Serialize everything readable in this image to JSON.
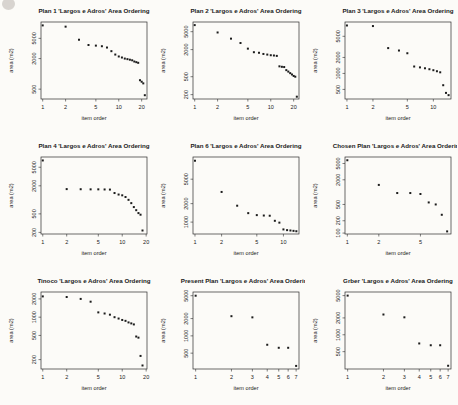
{
  "figure": {
    "background": "#fcfbf8"
  },
  "style": {
    "point_color": "#1c1c1c",
    "axis_color": "#2b2b2b",
    "text_color": "#1a1a1a"
  },
  "chart_data": [
    {
      "type": "scatter",
      "title": "Plan 1 'Largos e Adros' Area Ordering",
      "xlabel": "item order",
      "ylabel": "area (m2)",
      "xscale": "log",
      "yscale": "log",
      "x": [
        1,
        2,
        3,
        4,
        5,
        6,
        7,
        8,
        9,
        10,
        11,
        12,
        13,
        14,
        15,
        16,
        17,
        18,
        19,
        20,
        21,
        22
      ],
      "y": [
        9000,
        8500,
        4700,
        3700,
        3600,
        3500,
        3300,
        2800,
        2400,
        2200,
        2100,
        2000,
        1950,
        1900,
        1850,
        1750,
        1700,
        1650,
        750,
        700,
        650,
        380
      ],
      "xticks": [
        1,
        2,
        5,
        10,
        20
      ],
      "yticks": [
        500,
        2000,
        5000
      ],
      "xlim": [
        0.95,
        23.5
      ],
      "ylim": [
        320,
        10500
      ]
    },
    {
      "type": "scatter",
      "title": "Plan 2 'Largos e Adros' Area Ordering",
      "xlabel": "item order",
      "ylabel": "area (m2)",
      "xscale": "log",
      "yscale": "log",
      "x": [
        1,
        2,
        3,
        4,
        5,
        6,
        7,
        8,
        9,
        10,
        11,
        12,
        13,
        14,
        15,
        16,
        17,
        18,
        19,
        20,
        21,
        22
      ],
      "y": [
        7000,
        4800,
        3500,
        2800,
        2100,
        1750,
        1700,
        1600,
        1550,
        1500,
        1480,
        1450,
        850,
        830,
        820,
        700,
        650,
        600,
        560,
        520,
        500,
        180
      ],
      "xticks": [
        1,
        2,
        5,
        10,
        20
      ],
      "yticks": [
        200,
        500,
        2000,
        5000
      ],
      "xlim": [
        0.95,
        23.5
      ],
      "ylim": [
        160,
        8200
      ]
    },
    {
      "type": "scatter",
      "title": "Plan 3 'Largos e Adros' Area Ordering",
      "xlabel": "item order",
      "ylabel": "area (m2)",
      "xscale": "log",
      "yscale": "log",
      "x": [
        1,
        2,
        3,
        4,
        5,
        6,
        7,
        8,
        9,
        10,
        11,
        12,
        13,
        14,
        15
      ],
      "y": [
        8000,
        7800,
        3000,
        2700,
        2400,
        1350,
        1300,
        1250,
        1200,
        1150,
        1100,
        1050,
        600,
        430,
        390
      ],
      "xticks": [
        1,
        2,
        5,
        10
      ],
      "yticks": [
        500,
        1000,
        2000,
        5000
      ],
      "xlim": [
        0.95,
        16
      ],
      "ylim": [
        330,
        9300
      ]
    },
    {
      "type": "scatter",
      "title": "Plan 4 'Largos e Adros' Area Ordering",
      "xlabel": "item order",
      "ylabel": "area (m2)",
      "xscale": "log",
      "yscale": "log",
      "x": [
        1,
        2,
        3,
        4,
        5,
        6,
        7,
        8,
        9,
        10,
        11,
        12,
        13,
        14,
        15,
        16,
        17,
        18
      ],
      "y": [
        7000,
        1700,
        1690,
        1680,
        1680,
        1670,
        1660,
        1400,
        1300,
        1250,
        1150,
        1000,
        850,
        700,
        600,
        520,
        480,
        220
      ],
      "xticks": [
        1,
        2,
        5,
        10,
        20
      ],
      "yticks": [
        200,
        500,
        2000,
        5000
      ],
      "xlim": [
        0.95,
        20.5
      ],
      "ylim": [
        185,
        8300
      ]
    },
    {
      "type": "scatter",
      "title": "Plan 6 'Largos e Adros' Area Ordering",
      "xlabel": "item order",
      "ylabel": "area (m2)",
      "xscale": "log",
      "yscale": "log",
      "x": [
        1,
        2,
        3,
        4,
        5,
        6,
        7,
        8,
        9,
        10,
        11,
        12,
        13,
        14
      ],
      "y": [
        10000,
        3100,
        1850,
        1400,
        1300,
        1280,
        1270,
        1050,
        980,
        760,
        740,
        730,
        720,
        710
      ],
      "xticks": [
        1,
        2,
        5,
        10
      ],
      "yticks": [
        1000,
        2000,
        5000
      ],
      "xlim": [
        0.95,
        15
      ],
      "ylim": [
        640,
        11500
      ]
    },
    {
      "type": "scatter",
      "title": "Chosen Plan 'Largos e Adros' Area Ordering",
      "xlabel": "item order",
      "ylabel": "area (m2)",
      "xscale": "log",
      "yscale": "log",
      "x": [
        1,
        2,
        3,
        4,
        5,
        6,
        7,
        8,
        9
      ],
      "y": [
        6000,
        1500,
        950,
        950,
        900,
        560,
        500,
        280,
        110
      ],
      "xticks": [
        1,
        2,
        5
      ],
      "yticks": [
        100,
        200,
        500,
        2000,
        5000
      ],
      "xlim": [
        0.95,
        9.8
      ],
      "ylim": [
        95,
        7200
      ]
    },
    {
      "type": "scatter",
      "title": "Tinoco 'Largos e Adros' Area Ordering",
      "xlabel": "item order",
      "ylabel": "area (m2)",
      "xscale": "log",
      "yscale": "log",
      "x": [
        1,
        2,
        3,
        4,
        5,
        6,
        7,
        8,
        9,
        10,
        11,
        12,
        13,
        14,
        15,
        16,
        17,
        18
      ],
      "y": [
        2200,
        2150,
        2000,
        1800,
        1200,
        1150,
        1100,
        1000,
        950,
        900,
        870,
        820,
        790,
        760,
        480,
        460,
        230,
        160
      ],
      "xticks": [
        1,
        2,
        5,
        10,
        20
      ],
      "yticks": [
        200,
        500,
        1000,
        2000
      ],
      "xlim": [
        0.95,
        20.5
      ],
      "ylim": [
        140,
        2600
      ]
    },
    {
      "type": "scatter",
      "title": "Present Plan 'Largos e Adros' Area Ordering",
      "xlabel": "item order",
      "ylabel": "area (m2)",
      "xscale": "log",
      "yscale": "log",
      "x": [
        1,
        2,
        3,
        4,
        5,
        6,
        7
      ],
      "y": [
        5000,
        2200,
        2100,
        700,
        620,
        620,
        300
      ],
      "xticks": [
        1,
        2,
        3,
        4,
        5,
        6,
        7
      ],
      "yticks": [
        500,
        1000,
        2000,
        5000
      ],
      "xlim": [
        0.95,
        7.4
      ],
      "ylim": [
        265,
        5800
      ]
    },
    {
      "type": "scatter",
      "title": "Grber 'Largos e Adros' Area Ordering",
      "xlabel": "item order",
      "ylabel": "area (m2)",
      "xscale": "log",
      "yscale": "log",
      "x": [
        1,
        2,
        3,
        4,
        5,
        6,
        7
      ],
      "y": [
        5000,
        2300,
        2050,
        700,
        650,
        650,
        280
      ],
      "xticks": [
        1,
        2,
        3,
        4,
        5,
        6,
        7
      ],
      "yticks": [
        500,
        1000,
        2000,
        5000
      ],
      "xlim": [
        0.95,
        7.4
      ],
      "ylim": [
        245,
        5800
      ]
    }
  ]
}
